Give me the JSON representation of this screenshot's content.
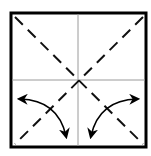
{
  "diagram": {
    "type": "origami-fold-diagram",
    "paper": {
      "x": 11,
      "y": 13,
      "width": 135,
      "height": 134,
      "border_color": "#000000",
      "border_width": 3,
      "fill": "#ffffff"
    },
    "creases": {
      "color": "#9a9a9a",
      "width": 1,
      "center": {
        "x": 78,
        "y": 80
      }
    },
    "fold_lines": {
      "style": "dashed",
      "color": "#111111",
      "width": 2,
      "dash": "11 7",
      "lines": [
        {
          "name": "diagonal-tl-br",
          "x1": 14,
          "y1": 16,
          "x2": 143,
          "y2": 144
        },
        {
          "name": "diagonal-tr-bl",
          "x1": 143,
          "y1": 16,
          "x2": 14,
          "y2": 144
        }
      ]
    },
    "arrows": [
      {
        "name": "left-fold-arrow",
        "path": "M 20 99 Q 58 100 66 136",
        "head_start": "left",
        "head_end": "down"
      },
      {
        "name": "right-fold-arrow",
        "path": "M 137 99 Q 99 100 91 136",
        "head_start": "right",
        "head_end": "down"
      }
    ]
  }
}
